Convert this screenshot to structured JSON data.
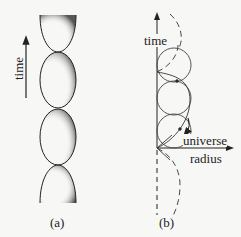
{
  "panel_a": {
    "axis_label": "time",
    "caption": "(a)"
  },
  "panel_b": {
    "y_axis_label": "time",
    "x_axis_label_line1": "universe",
    "x_axis_label_line2": "radius",
    "caption": "(b)"
  },
  "colors": {
    "ink": "#222222",
    "background": "#f7f7f5"
  }
}
